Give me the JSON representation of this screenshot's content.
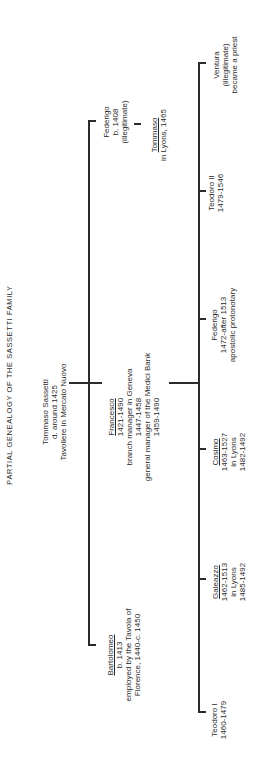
{
  "title": "PARTIAL GENEALOGY OF THE SASSETTI FAMILY",
  "root": {
    "lines": [
      "Tommaso Sassetti",
      "d. around 1425",
      "Tavoliere in Mercato Nuovo"
    ]
  },
  "generation1": [
    {
      "id": "federigo-sr",
      "name": "Federigo",
      "lines": [
        "b. 1408",
        "(illegitimate)"
      ],
      "child": {
        "name": "Tommaso",
        "lines": [
          "in Lyons, 1465"
        ]
      }
    },
    {
      "id": "francesco",
      "name": "Francesco",
      "lines": [
        "1421-1490",
        "branch manager in Geneva",
        "1447-1458",
        "general manager of the Medici Bank",
        "1459-1490"
      ]
    },
    {
      "id": "bartolomeo",
      "name": "Bartolomeo",
      "lines": [
        "b. 1413",
        "employed by the Tavola of",
        "Florence, 1440-c. 1450"
      ]
    }
  ],
  "generation2": [
    {
      "id": "ventura",
      "name": "Ventura",
      "lines": [
        "(illegitimate)",
        "became a priest"
      ]
    },
    {
      "id": "teodoro-ii",
      "name": "Teodoro II",
      "lines": [
        "1479-1546"
      ]
    },
    {
      "id": "federigo-jr",
      "name": "Federigo",
      "lines": [
        "1472-after 1513",
        "apostolic protonotary"
      ]
    },
    {
      "id": "cosimo",
      "name": "Cosimo",
      "lines": [
        "1463-1527",
        "in Lyons",
        "1482-1492"
      ]
    },
    {
      "id": "galeazzo",
      "name": "Galeazzo",
      "lines": [
        "1462-1513",
        "in Lyons",
        "1485-1492"
      ]
    },
    {
      "id": "teodoro-i",
      "name": "Teodoro I",
      "lines": [
        "1460-1479"
      ]
    }
  ]
}
